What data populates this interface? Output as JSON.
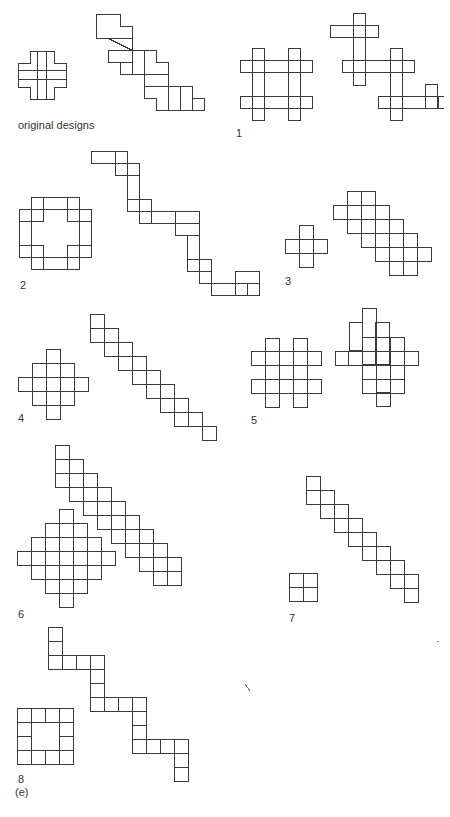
{
  "figure": {
    "panel_label": "(e)",
    "designs": [
      {
        "id": "original",
        "label": "original designs"
      },
      {
        "id": "1",
        "label": "1"
      },
      {
        "id": "2",
        "label": "2"
      },
      {
        "id": "3",
        "label": "3"
      },
      {
        "id": "4",
        "label": "4"
      },
      {
        "id": "5",
        "label": "5"
      },
      {
        "id": "6",
        "label": "6"
      },
      {
        "id": "7",
        "label": "7"
      },
      {
        "id": "8",
        "label": "8"
      }
    ]
  }
}
